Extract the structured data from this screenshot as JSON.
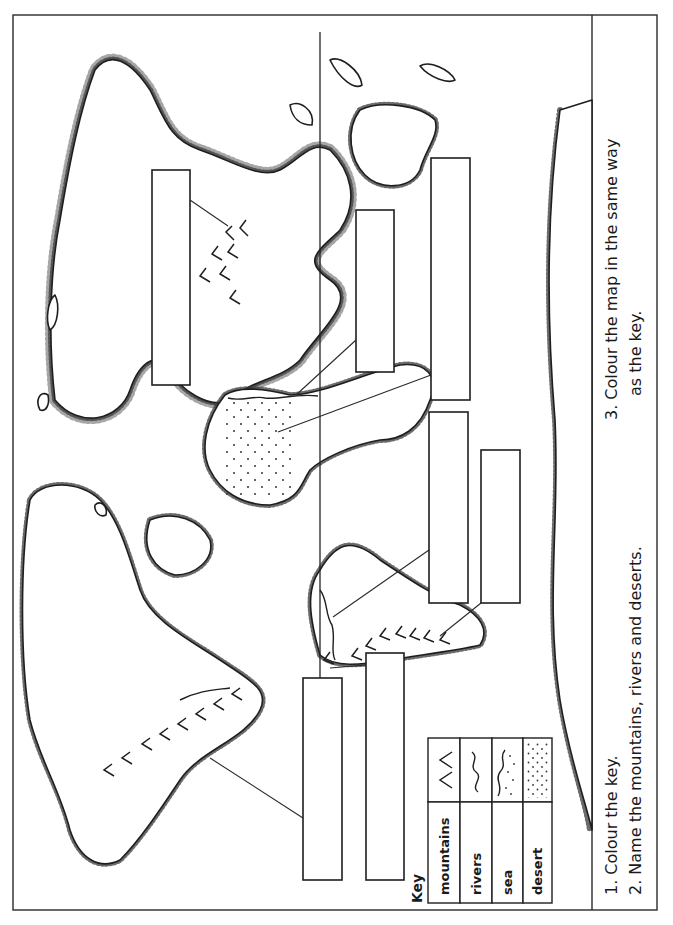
{
  "worksheet": {
    "orientation": "rotated-90-ccw",
    "map": {
      "type": "world-outline-map",
      "features": [
        "mountains",
        "rivers",
        "sea",
        "desert"
      ],
      "label_boxes": [
        {
          "id": "box-1",
          "points_to": "mountains (Asia)",
          "value": ""
        },
        {
          "id": "box-2",
          "points_to": "river (Africa/Nile)",
          "value": ""
        },
        {
          "id": "box-3",
          "points_to": "desert (Africa/Sahara)",
          "value": ""
        },
        {
          "id": "box-4",
          "points_to": "river (South America/Amazon)",
          "value": ""
        },
        {
          "id": "box-5",
          "points_to": "mountains (South America/Andes)",
          "value": ""
        },
        {
          "id": "box-6",
          "points_to": "mountains (North America/Rockies)",
          "value": ""
        },
        {
          "id": "box-7",
          "points_to": "",
          "value": ""
        }
      ]
    },
    "key": {
      "title": "Key",
      "rows": [
        {
          "label": "mountains",
          "symbol": "mountains-icon"
        },
        {
          "label": "rivers",
          "symbol": "river-icon"
        },
        {
          "label": "sea",
          "symbol": "sea-icon"
        },
        {
          "label": "desert",
          "symbol": "desert-icon"
        }
      ]
    },
    "instructions": {
      "item1": "1.  Colour the key.",
      "item2": "2.  Name the mountains, rivers and deserts.",
      "item3_line1": "3.  Colour the map in the same way",
      "item3_line2": "as the key."
    }
  }
}
